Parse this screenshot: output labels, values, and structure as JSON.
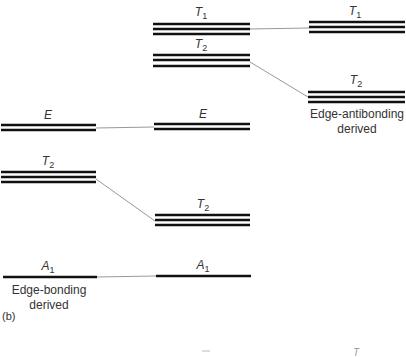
{
  "figure": {
    "panel_label": "(b)",
    "captions": {
      "antibonding": [
        "Edge-antibonding",
        "derived"
      ],
      "bonding": [
        "Edge-bonding",
        "derived"
      ]
    },
    "levels": {
      "left_E": {
        "sym": "E",
        "sub": ""
      },
      "left_T2": {
        "sym": "T",
        "sub": "2"
      },
      "left_A1": {
        "sym": "A",
        "sub": "1"
      },
      "mid_T1": {
        "sym": "T",
        "sub": "1"
      },
      "mid_T2_upper": {
        "sym": "T",
        "sub": "2"
      },
      "mid_E": {
        "sym": "E",
        "sub": ""
      },
      "mid_T2_lower": {
        "sym": "T",
        "sub": "2"
      },
      "mid_A1": {
        "sym": "A",
        "sub": "1"
      },
      "right_T1": {
        "sym": "T",
        "sub": "1"
      },
      "right_T2": {
        "sym": "T",
        "sub": "2"
      }
    },
    "bottom_fragment": "T",
    "colors": {
      "level": "#111111",
      "connector": "#999999",
      "text": "#333333"
    }
  }
}
